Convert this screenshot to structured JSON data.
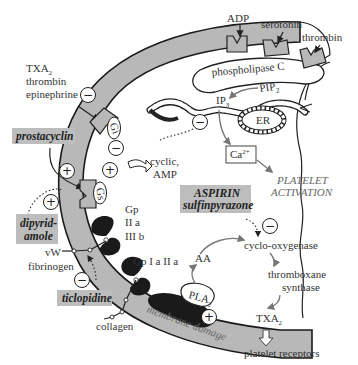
{
  "diagram": {
    "agonists_top": {
      "adp": "ADP",
      "serotonin": "serotonin",
      "thrombin": "thrombin"
    },
    "inhibitory_agonists": {
      "line1": "TXA",
      "line1_sub": "2",
      "line2": "thrombin",
      "line3": "epinephrine",
      "sign": "−"
    },
    "enzymes": {
      "phospholipase_c": "phospholipase C",
      "pip2": "PIP",
      "pip2_sub": "2",
      "ip3": "IP",
      "ip3_sub": "3",
      "er": "ER",
      "ca": "Ca",
      "ca_sup": "2+",
      "cyclic_amp_1": "cyclic,",
      "cyclic_amp_2": "AMP",
      "cyclooxygenase": "cyclo-oxygenase",
      "thromboxane_1": "thromboxane",
      "thromboxane_2": "synthase",
      "aa": "AA",
      "pla2": "PLA",
      "pla2_sub": "2",
      "txa2": "TXA",
      "txa2_sub": "2"
    },
    "g_proteins": {
      "gi": "Gi",
      "gs": "Gs"
    },
    "signs": {
      "minus": "−",
      "plus": "+"
    },
    "outcomes": {
      "platelet_activation_1": "PLATELET",
      "platelet_activation_2": "ACTIVATION",
      "platelet_receptors": "platelet receptors",
      "membrane_damage": "membrane damage"
    },
    "receptors": {
      "gp2b3a_1": "Gp",
      "gp2b3a_2": "II a",
      "gp2b3a_3": "III b",
      "gp1a2a": "Gp  I a  II a"
    },
    "ligands": {
      "vw": "vW",
      "fibrinogen": "fibrinogen",
      "collagen": "collagen"
    },
    "drugs": {
      "prostacyclin": "prostacyclin",
      "dipyridamole_1": "dipyrid-",
      "dipyridamole_2": "amole",
      "ticlopidine": "ticlopidine",
      "aspirin": "ASPIRIN",
      "sulfinpyrazone": "sulfinpyrazone"
    },
    "colors": {
      "membrane_fill": "#b8b8b8",
      "drug_box": "#bdbdbd",
      "outline": "#1a1a1a",
      "activation_text": "#666666"
    }
  }
}
